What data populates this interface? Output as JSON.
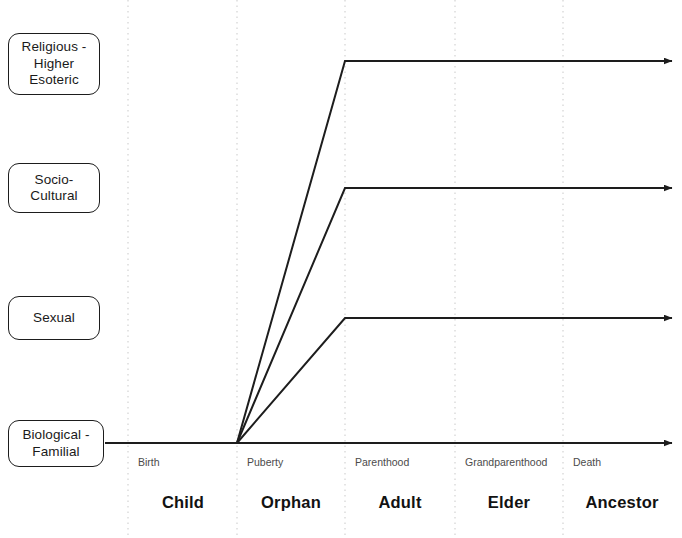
{
  "diagram": {
    "colors": {
      "line": "#1d1d1d",
      "gridline": "#c9c9c9",
      "box_border": "#1d1d1d",
      "box_fill": "#ffffff",
      "tick_text": "#4b4b4b",
      "stage_text": "#121212",
      "background": "#ffffff"
    },
    "dimension_labels": [
      {
        "id": "religious",
        "text": "Religious -\nHigher\nEsoteric",
        "box": {
          "x": 8,
          "y": 33,
          "width": 92,
          "height": 62
        }
      },
      {
        "id": "socio-cultural",
        "text": "Socio-\nCultural",
        "box": {
          "x": 8,
          "y": 163,
          "width": 92,
          "height": 50
        }
      },
      {
        "id": "sexual",
        "text": "Sexual",
        "box": {
          "x": 8,
          "y": 296,
          "width": 92,
          "height": 44
        }
      },
      {
        "id": "biological",
        "text": "Biological -\nFamilial",
        "box": {
          "x": 8,
          "y": 420,
          "width": 96,
          "height": 47
        }
      }
    ],
    "gridlines": [
      {
        "id": "birth",
        "x": 128
      },
      {
        "id": "puberty",
        "x": 237
      },
      {
        "id": "parenthood",
        "x": 345
      },
      {
        "id": "grandparenthood",
        "x": 455
      },
      {
        "id": "death",
        "x": 563
      }
    ],
    "tick_labels": [
      {
        "id": "birth",
        "text": "Birth",
        "x": 138,
        "y": 456
      },
      {
        "id": "puberty",
        "text": "Puberty",
        "x": 247,
        "y": 456
      },
      {
        "id": "parenthood",
        "text": "Parenthood",
        "x": 355,
        "y": 456
      },
      {
        "id": "grandparenthood",
        "text": "Grandparenthood",
        "x": 465,
        "y": 456
      },
      {
        "id": "death",
        "text": "Death",
        "x": 573,
        "y": 456
      }
    ],
    "stage_labels": [
      {
        "id": "child",
        "text": "Child",
        "x": 183,
        "y": 493
      },
      {
        "id": "orphan",
        "text": "Orphan",
        "x": 291,
        "y": 493
      },
      {
        "id": "adult",
        "text": "Adult",
        "x": 400,
        "y": 493
      },
      {
        "id": "elder",
        "text": "Elder",
        "x": 509,
        "y": 493
      },
      {
        "id": "ancestor",
        "text": "Ancestor",
        "x": 622,
        "y": 493
      }
    ],
    "trajectories": [
      {
        "id": "biological-familial",
        "name": "Biological - Familial baseline",
        "points": "105,443 672,443",
        "arrow_at": {
          "x": 680,
          "y": 443
        }
      },
      {
        "id": "sexual",
        "name": "Sexual rise at puberty",
        "points": "237,443 345,318 672,318",
        "arrow_at": {
          "x": 680,
          "y": 318
        }
      },
      {
        "id": "socio-cultural",
        "name": "Socio-Cultural rise at puberty",
        "points": "237,443 345,188 672,188",
        "arrow_at": {
          "x": 680,
          "y": 188
        }
      },
      {
        "id": "religious-higher-esoteric",
        "name": "Religious - Higher Esoteric rise at puberty",
        "points": "237,443 345,61 672,61",
        "arrow_at": {
          "x": 680,
          "y": 61
        }
      }
    ]
  }
}
